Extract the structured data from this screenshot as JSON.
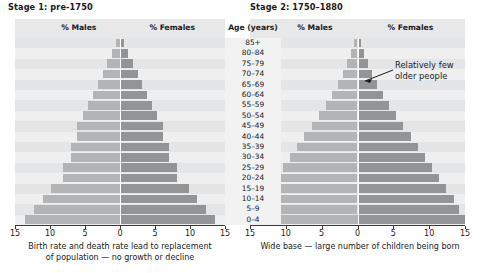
{
  "chart_data": {
    "type": "bar",
    "categories": [
      "85+",
      "80–84",
      "75–79",
      "70–74",
      "65–69",
      "60–64",
      "55–59",
      "50–54",
      "45–49",
      "40–44",
      "35–39",
      "30–34",
      "25–29",
      "20–24",
      "15–19",
      "10–14",
      "5–9",
      "0–4"
    ],
    "xlabel": "",
    "ylabel": "Age (years)",
    "xlim": [
      -15,
      15
    ],
    "xticks": [
      15,
      10,
      5,
      0,
      5,
      10,
      15
    ],
    "grid": true,
    "legend_position": "top",
    "panels": [
      {
        "title": "Stage 1: pre-1750",
        "caption": "Birth rate and death rate lead to replacement of population — no growth or decline",
        "series": [
          {
            "name": "% Males",
            "values": [
              0.6,
              1.2,
              1.8,
              2.5,
              3.2,
              3.9,
              4.6,
              5.3,
              6.1,
              6.1,
              7.0,
              7.0,
              8.2,
              8.2,
              9.8,
              11.0,
              12.3,
              13.6
            ]
          },
          {
            "name": "% Females",
            "values": [
              0.6,
              1.2,
              1.8,
              2.5,
              3.2,
              3.9,
              4.6,
              5.3,
              6.1,
              6.1,
              7.0,
              7.0,
              8.2,
              8.2,
              9.8,
              11.0,
              12.3,
              13.6
            ]
          }
        ]
      },
      {
        "title": "Stage 2: 1750–1880",
        "caption": "Wide base — large number of children being born",
        "annotation": "Relatively few older people",
        "series": [
          {
            "name": "% Males",
            "values": [
              0.5,
              0.9,
              1.4,
              2.0,
              2.7,
              3.5,
              4.4,
              5.4,
              6.4,
              7.4,
              8.4,
              9.4,
              10.4,
              11.4,
              12.4,
              13.4,
              14.2,
              15.0
            ]
          },
          {
            "name": "% Females",
            "values": [
              0.5,
              0.9,
              1.4,
              2.0,
              2.7,
              3.5,
              4.4,
              5.4,
              6.4,
              7.4,
              8.4,
              9.4,
              10.4,
              11.4,
              12.4,
              13.4,
              14.2,
              15.0
            ]
          }
        ]
      }
    ],
    "colors": {
      "male_bar": "#b3b4b5",
      "female_bar": "#939496",
      "plot_background": "#ececed",
      "band": "#e4e5e6",
      "axis": "#3a3a3a",
      "text": "#1a1a1a"
    }
  },
  "left_panel": {
    "title": "Stage 1: pre-1750",
    "males_label": "% Males",
    "females_label": "% Females",
    "caption_line1": "Birth rate and death rate lead to replacement",
    "caption_line2": "of population — no growth or decline"
  },
  "right_panel": {
    "title": "Stage 2: 1750–1880",
    "males_label": "% Males",
    "females_label": "% Females",
    "caption_line1": "Wide base — large number of children being born",
    "annotation_line1": "Relatively few",
    "annotation_line2": "older people"
  },
  "age_axis": {
    "header": "Age (years)",
    "labels": [
      "85+",
      "80–84",
      "75–79",
      "70–74",
      "65–69",
      "60–64",
      "55–59",
      "50–54",
      "45–49",
      "40–44",
      "35–39",
      "30–34",
      "25–29",
      "20–24",
      "15–19",
      "10–14",
      "5–9",
      "0–4"
    ]
  },
  "x_axis": {
    "ticks": [
      "15",
      "10",
      "5",
      "0",
      "5",
      "10",
      "15"
    ]
  }
}
